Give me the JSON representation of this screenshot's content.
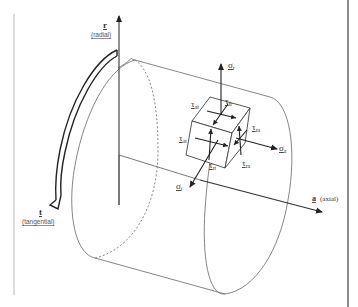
{
  "diagram": {
    "axes": {
      "radial": {
        "symbol": "r",
        "name": "(radial)"
      },
      "tangential": {
        "symbol": "t",
        "name": "(tangential)"
      },
      "axial": {
        "symbol": "a",
        "name": "(axial)"
      }
    },
    "stresses": {
      "sigma_r": {
        "symbol": "σ",
        "sub": "r"
      },
      "sigma_a": {
        "symbol": "σ",
        "sub": "a"
      },
      "sigma_t": {
        "symbol": "σ",
        "sub": "t"
      },
      "tau_at": {
        "symbol": "τ",
        "sub": "at"
      },
      "tau_tr": {
        "symbol": "τ",
        "sub": "tr"
      },
      "tau_ra": {
        "symbol": "τ",
        "sub": "ra"
      },
      "tau_at_side": {
        "symbol": "τ",
        "sub": "at"
      },
      "tau_ra_side": {
        "symbol": "τ",
        "sub": "ra"
      },
      "tau_rt": {
        "symbol": "τ",
        "sub": "rt"
      }
    },
    "colors": {
      "line": "#333333",
      "thin": "#777777",
      "frame": "#999999"
    }
  }
}
